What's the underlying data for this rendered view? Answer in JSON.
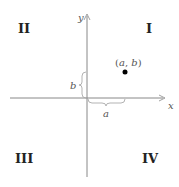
{
  "diagram": {
    "title": "",
    "quadrants": {
      "q1": "I",
      "q2": "II",
      "q3": "III",
      "q4": "IV"
    },
    "axes": {
      "x_label": "x",
      "y_label": "y"
    },
    "point": {
      "label_open": "(",
      "a": "a",
      "comma": ", ",
      "b": "b",
      "label_close": ")"
    },
    "braces": {
      "horizontal_label": "a",
      "vertical_label": "b"
    },
    "colors": {
      "axis": "#888888",
      "brace": "#aaaaaa",
      "point": "#000000",
      "quadrant_text": "#222222"
    }
  }
}
